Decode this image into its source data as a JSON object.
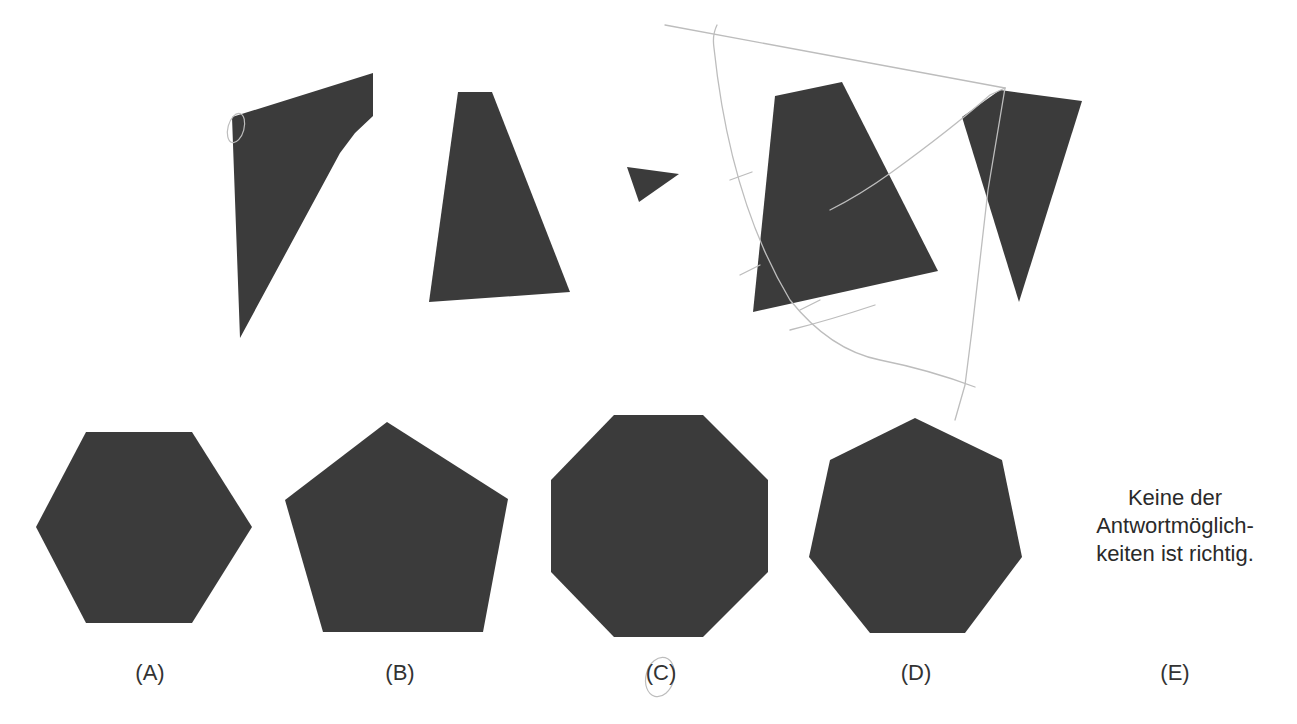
{
  "puzzle": {
    "fill_color": "#3b3b3b",
    "pencil_color": "#bdbdbd",
    "pieces": [
      {
        "name": "piece-1",
        "points": "232,117 373,73 373,116 355,133 340,153 240,338"
      },
      {
        "name": "piece-2",
        "points": "458,92 492,92 570,292 429,302"
      },
      {
        "name": "piece-3",
        "points": "627,167 679,174 639,202"
      },
      {
        "name": "piece-4",
        "points": "775,96 842,82 938,271 753,312"
      },
      {
        "name": "piece-5",
        "points": "962,117 1000,90 1082,101 1019,302"
      }
    ],
    "options": [
      {
        "id": "A",
        "label": "(A)",
        "label_x": 150,
        "kind": "hexagon",
        "points": "86,432 192,432 252,527 192,623 86,623 36,527"
      },
      {
        "id": "B",
        "label": "(B)",
        "label_x": 400,
        "kind": "pentagon",
        "points": "387,422 508,499 483,632 323,632 285,500"
      },
      {
        "id": "C",
        "label": "(C)",
        "label_x": 661,
        "kind": "octagon",
        "points": "614,415 703,415 768,480 768,572 703,637 614,637 551,572 551,480"
      },
      {
        "id": "D",
        "label": "(D)",
        "label_x": 916,
        "kind": "heptagon",
        "points": "915,418 1002,460 1022,557 965,633 870,633 809,557 830,460"
      },
      {
        "id": "E",
        "label": "(E)",
        "label_x": 1175,
        "kind": "text",
        "text_lines": [
          "Keine der",
          "Antwortmöglich-",
          "keiten ist richtig."
        ]
      }
    ],
    "annotations": {
      "pencil_strokes": [
        "M665,25 Q830,55 1005,88",
        "M717,25 Q712,35 714,48 Q730,200 790,300 Q830,350 880,360 Q930,370 975,387",
        "M1005,88 L990,95 Q950,130 892,172 Q860,195 830,210",
        "M1005,88 L988,190 L972,330 L965,385 L955,420",
        "M790,330 Q830,320 875,305",
        "M730,180 L752,172",
        "M740,275 L760,265",
        "M800,310 L820,300"
      ],
      "circle_marks": [
        {
          "cx": 236,
          "cy": 128,
          "rx": 8,
          "ry": 15
        },
        {
          "cx": 660,
          "cy": 677,
          "rx": 14,
          "ry": 20
        }
      ]
    }
  }
}
